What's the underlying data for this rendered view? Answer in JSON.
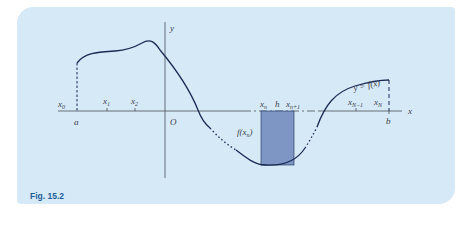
{
  "figure": {
    "caption": "Fig. 15.2",
    "colors": {
      "panel_background": "#d6e9f6",
      "curve": "#1b2a55",
      "axis": "#4a4f5c",
      "shaded_strip": "#7d96c4",
      "caption": "#1f5e9c"
    },
    "axes": {
      "x_label": "x",
      "y_label": "y",
      "origin_label": "O"
    },
    "curve_label": "y = f(x)",
    "strip_height_label": "f(x_n)",
    "strip_height_label_parts": {
      "f": "f(x",
      "sub": "n",
      "close": ")"
    },
    "tick_labels": [
      {
        "id": "x0",
        "base": "x",
        "sub": "0"
      },
      {
        "id": "x1",
        "base": "x",
        "sub": "1"
      },
      {
        "id": "x2",
        "base": "x",
        "sub": "2"
      },
      {
        "id": "xn",
        "base": "x",
        "sub": "n"
      },
      {
        "id": "h",
        "base": "h",
        "sub": ""
      },
      {
        "id": "xn1",
        "base": "x",
        "sub": "n+1"
      },
      {
        "id": "xN1",
        "base": "x",
        "sub": "N−1"
      },
      {
        "id": "xN",
        "base": "x",
        "sub": "N"
      }
    ],
    "bound_labels": {
      "a": "a",
      "b": "b"
    }
  }
}
